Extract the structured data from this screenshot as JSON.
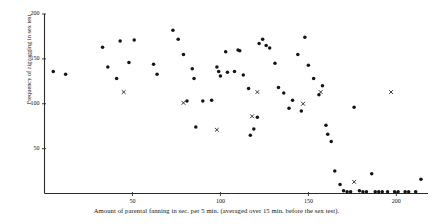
{
  "chart_data": {
    "type": "scatter",
    "title": "",
    "xlabel": "Amount of parental fanning in sec. per 5 min.  (averaged over 15 min. before the sex test).",
    "ylabel": "Frequency of zigzagging in sex test",
    "xlim": [
      0,
      218
    ],
    "ylim": [
      0,
      200
    ],
    "xticks": [
      50,
      100,
      150,
      200
    ],
    "yticks": [
      50,
      100,
      150,
      200
    ],
    "xtick_labels": [
      "50",
      "100",
      "150",
      "200"
    ],
    "ytick_labels": [
      "50",
      "100",
      "150",
      "200"
    ],
    "grid": false,
    "legend": "none",
    "series": [
      {
        "name": "dot",
        "marker": "filled-circle",
        "color": "#141414",
        "points": [
          [
            5,
            136
          ],
          [
            12,
            133
          ],
          [
            33,
            163
          ],
          [
            36,
            141
          ],
          [
            41,
            128
          ],
          [
            43,
            170
          ],
          [
            48,
            146
          ],
          [
            51,
            171
          ],
          [
            62,
            144
          ],
          [
            64,
            133
          ],
          [
            73,
            182
          ],
          [
            76,
            172
          ],
          [
            79,
            155
          ],
          [
            81,
            103
          ],
          [
            84,
            139
          ],
          [
            85,
            128
          ],
          [
            86,
            74
          ],
          [
            90,
            103
          ],
          [
            95,
            104
          ],
          [
            98,
            141
          ],
          [
            99,
            136
          ],
          [
            100,
            131
          ],
          [
            103,
            158
          ],
          [
            104,
            135
          ],
          [
            108,
            136
          ],
          [
            110,
            160
          ],
          [
            111,
            159
          ],
          [
            113,
            132
          ],
          [
            116,
            117
          ],
          [
            117,
            65
          ],
          [
            119,
            72
          ],
          [
            121,
            85
          ],
          [
            122,
            167
          ],
          [
            124,
            172
          ],
          [
            126,
            165
          ],
          [
            128,
            162
          ],
          [
            131,
            145
          ],
          [
            133,
            118
          ],
          [
            136,
            112
          ],
          [
            139,
            95
          ],
          [
            141,
            104
          ],
          [
            144,
            155
          ],
          [
            146,
            92
          ],
          [
            148,
            174
          ],
          [
            150,
            143
          ],
          [
            153,
            128
          ],
          [
            156,
            110
          ],
          [
            158,
            120
          ],
          [
            160,
            76
          ],
          [
            161,
            66
          ],
          [
            163,
            58
          ],
          [
            165,
            25
          ],
          [
            168,
            10
          ],
          [
            170,
            3
          ],
          [
            172,
            2
          ],
          [
            174,
            2
          ],
          [
            176,
            96
          ],
          [
            179,
            3
          ],
          [
            181,
            2
          ],
          [
            183,
            2
          ],
          [
            186,
            22
          ],
          [
            188,
            2
          ],
          [
            190,
            2
          ],
          [
            192,
            2
          ],
          [
            195,
            2
          ],
          [
            199,
            2
          ],
          [
            201,
            2
          ],
          [
            205,
            2
          ],
          [
            207,
            2
          ],
          [
            211,
            2
          ],
          [
            214,
            16
          ]
        ]
      },
      {
        "name": "cross",
        "marker": "x",
        "color": "#141414",
        "points": [
          [
            45,
            113
          ],
          [
            79,
            101
          ],
          [
            98,
            71
          ],
          [
            118,
            86
          ],
          [
            121,
            113
          ],
          [
            147,
            100
          ],
          [
            157,
            113
          ],
          [
            176,
            13
          ],
          [
            197,
            113
          ]
        ]
      }
    ]
  }
}
